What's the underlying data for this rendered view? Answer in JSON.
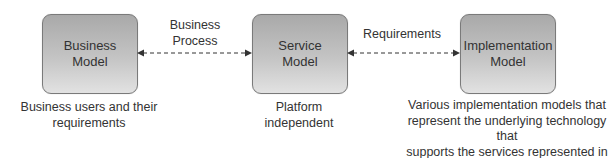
{
  "boxes": [
    {
      "line1": "Business",
      "line2": "Model"
    },
    {
      "line1": "Service",
      "line2": "Model"
    },
    {
      "line1": "Implementation",
      "line2": "Model"
    }
  ],
  "connectors": [
    {
      "label_line1": "Business",
      "label_line2": "Process"
    },
    {
      "label_line1": "Requirements"
    }
  ],
  "captions": [
    {
      "line1": "Business users and their",
      "line2": "requirements"
    },
    {
      "line1": "Platform",
      "line2": "independent"
    },
    {
      "line1": "Various implementation models that",
      "line2": "represent the underlying technology that",
      "line3": "supports the services represented in the",
      "line4": "service model"
    }
  ],
  "colors": {
    "box_top": "#a9a9a9",
    "box_bottom": "#e2e2e2",
    "arrow": "#333333"
  }
}
